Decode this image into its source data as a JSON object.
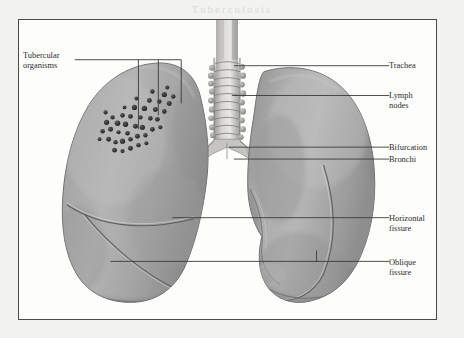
{
  "figure": {
    "kind": "anatomical-illustration",
    "frame_color": "#4a4a4a",
    "background_color": "#fdfdfc",
    "page_background": "#f2f2f0",
    "tissue_color": "#a8a8a8",
    "tissue_shadow": "#7e7e7e",
    "tissue_highlight": "#c4c4c4",
    "tubercle_color": "#2d2d2d",
    "leader_color": "#3a3a3a",
    "label_color": "#2b2b2b"
  },
  "bleed_text": {
    "top": "Tuberculosis",
    "right": "Tuberculosis"
  },
  "labels": {
    "left": [
      {
        "id": "tubercular-organisms",
        "text": "Tubercular\norganisms",
        "x": 22,
        "y": 56
      }
    ],
    "right": [
      {
        "id": "trachea",
        "text": "Trachea",
        "x": 388,
        "y": 62
      },
      {
        "id": "lymph-nodes",
        "text": "Lymph\nnodes",
        "x": 388,
        "y": 89
      },
      {
        "id": "bifurcation",
        "text": "Bifurcation",
        "x": 388,
        "y": 133
      },
      {
        "id": "bronchi",
        "text": "Bronchi",
        "x": 388,
        "y": 144
      },
      {
        "id": "horizontal-fissure",
        "text": "Horizontal\nfissure",
        "x": 388,
        "y": 196
      },
      {
        "id": "oblique-fissure",
        "text": "Oblique\nfissure",
        "x": 388,
        "y": 240
      }
    ]
  },
  "structures": [
    {
      "id": "trachea",
      "name": "Trachea",
      "description": "Cartilage-ringed airway at top center"
    },
    {
      "id": "lymph-nodes",
      "name": "Lymph nodes",
      "description": "Nodular bodies flanking the trachea"
    },
    {
      "id": "bifurcation",
      "name": "Bifurcation",
      "description": "Carina where trachea splits"
    },
    {
      "id": "bronchi",
      "name": "Bronchi",
      "description": "Main stem airways entering each lung"
    },
    {
      "id": "horizontal-fissure",
      "name": "Horizontal fissure",
      "description": "Upper curved fissure on right lung (viewer left)"
    },
    {
      "id": "oblique-fissure",
      "name": "Oblique fissure",
      "description": "Lower diagonal fissure on both lungs"
    },
    {
      "id": "tubercular-organisms",
      "name": "Tubercular organisms",
      "description": "Dark granular cluster in upper lobe"
    }
  ]
}
